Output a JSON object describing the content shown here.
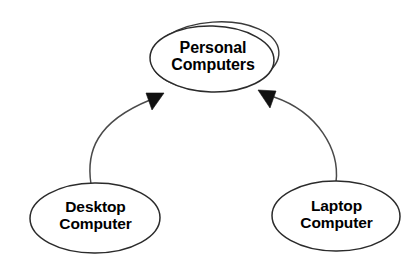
{
  "diagram": {
    "background_color": "#ffffff",
    "stroke_color": "#2b2b2b",
    "arrow_fill_color": "#111111",
    "nodes": [
      {
        "id": "personal-computers",
        "shape": "ellipse",
        "double_outline": true,
        "label_line1": "Personal",
        "label_line2": "Computers"
      },
      {
        "id": "desktop-computer",
        "shape": "ellipse",
        "double_outline": false,
        "label_line1": "Desktop",
        "label_line2": "Computer"
      },
      {
        "id": "laptop-computer",
        "shape": "ellipse",
        "double_outline": false,
        "label_line1": "Laptop",
        "label_line2": "Computer"
      }
    ],
    "edges": [
      {
        "id": "desktop-to-personal",
        "from": "desktop-computer",
        "to": "personal-computers",
        "arrowhead": "filled-triangle",
        "label": ""
      },
      {
        "id": "laptop-to-personal",
        "from": "laptop-computer",
        "to": "personal-computers",
        "arrowhead": "filled-triangle",
        "label": ""
      }
    ]
  }
}
